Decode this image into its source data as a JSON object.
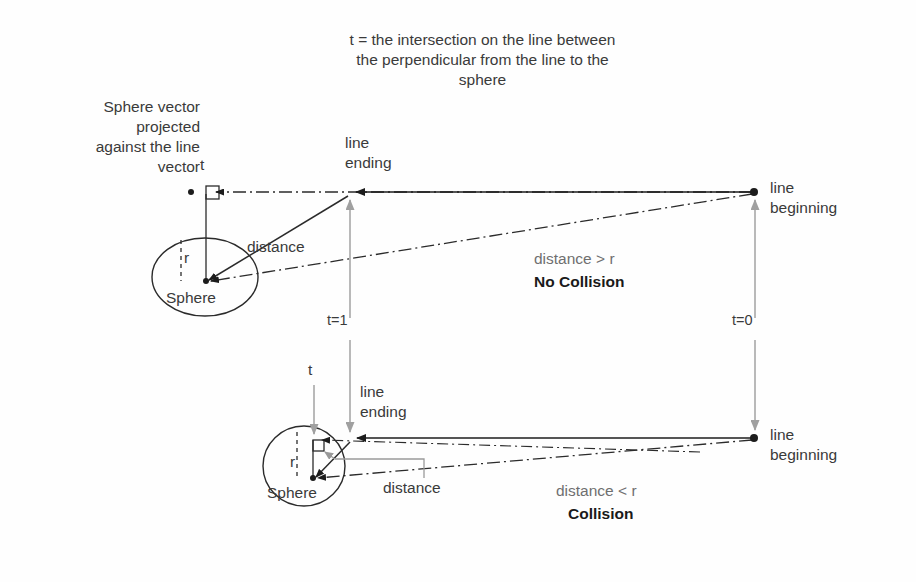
{
  "diagram": {
    "title_note": "t = the intersection on the line between\nthe perpendicular from the line to the\nsphere",
    "left_note": "Sphere vector\nprojected\nagainst the line\nvector",
    "upper": {
      "t_label": "t",
      "line_ending_label": "line\nending",
      "line_beginning_label": "line\nbeginning",
      "distance_label": "distance",
      "radius_label": "r",
      "sphere_label": "Sphere",
      "t_one_label": "t=1",
      "t_zero_label": "t=0",
      "condition_label": "distance > r",
      "result_label": "No Collision"
    },
    "lower": {
      "t_label": "t",
      "line_ending_label": "line\nending",
      "line_beginning_label": "line\nbeginning",
      "distance_label": "distance",
      "radius_label": "r",
      "sphere_label": "Sphere",
      "condition_label": "distance < r",
      "result_label": "Collision"
    },
    "colors": {
      "ink": "#2b2b2b",
      "gray": "#8a8a8a",
      "text": "#3a3a3a",
      "background": "#ffffff"
    }
  }
}
